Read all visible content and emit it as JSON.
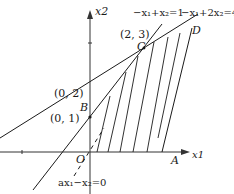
{
  "diagram": {
    "type": "linear-programming-feasible-region",
    "axes": {
      "x_label": "x1",
      "y_label": "x2",
      "origin_label": "O"
    },
    "points": {
      "B": {
        "label": "B",
        "coord_label": "(0, 1)"
      },
      "y2": {
        "coord_label": "(0, 2)"
      },
      "C": {
        "label": "C",
        "coord_label": "(2, 3)"
      },
      "D": {
        "label": "D"
      },
      "A": {
        "label": "A"
      }
    },
    "lines": [
      {
        "name": "line-1",
        "equation": "−x₁+x₂=1"
      },
      {
        "name": "line-2",
        "equation": "−x₁+2x₂=4"
      },
      {
        "name": "objective",
        "equation": "ax₁−x₂=0",
        "style": "dashed"
      }
    ],
    "colors": {
      "stroke": "#1a1a1a",
      "axis": "#333333"
    }
  }
}
